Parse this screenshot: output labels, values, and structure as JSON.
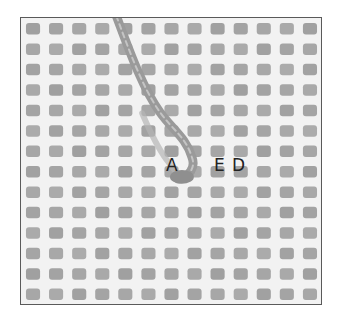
{
  "figure": {
    "labels": {
      "a": "A",
      "e": "E",
      "d": "D"
    },
    "colors": {
      "canvas_threads": "#f4f4f4",
      "holes": "#a6a6a6",
      "yarn": "#9a9a9a",
      "yarn_highlight": "#c4c4c4",
      "frame": "#5a5a5a"
    },
    "grid": {
      "columns": 13,
      "rows": 14
    }
  }
}
